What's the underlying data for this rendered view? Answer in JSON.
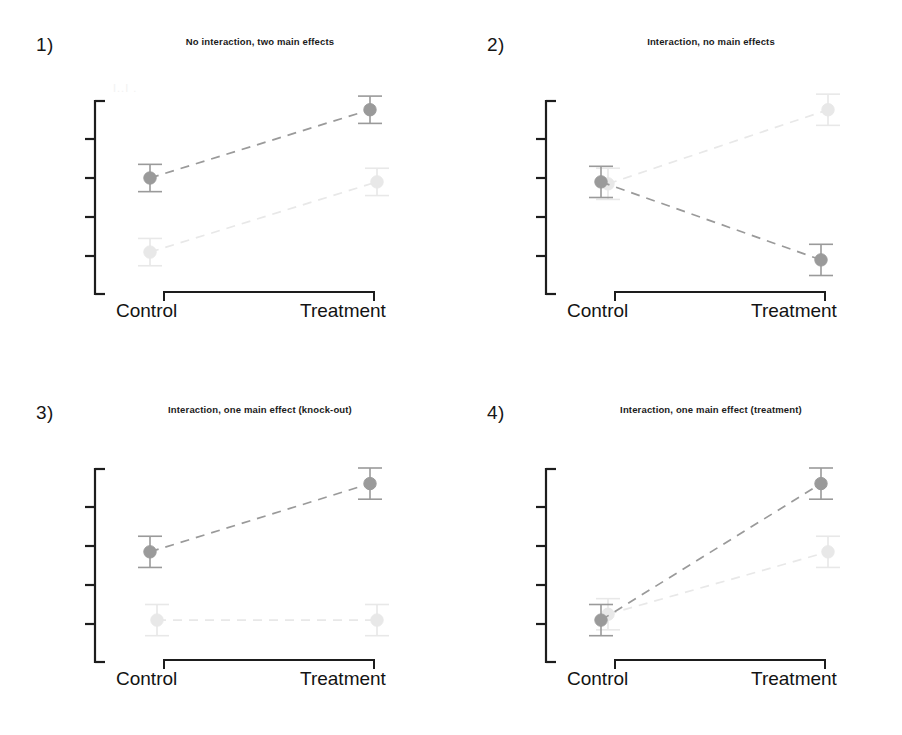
{
  "figure": {
    "background": "#ffffff",
    "width": 902,
    "height": 735
  },
  "panels": [
    {
      "number": "1)",
      "title": "No interaction, two main effects",
      "ghost_legend": "I..I .",
      "x_labels": {
        "left": "Control",
        "right": "Treatment"
      }
    },
    {
      "number": "2)",
      "title": "Interaction, no main effects",
      "ghost_legend": "",
      "x_labels": {
        "left": "Control",
        "right": "Treatment"
      }
    },
    {
      "number": "3)",
      "title": "Interaction, one main effect (knock-out)",
      "ghost_legend": "",
      "x_labels": {
        "left": "Control",
        "right": "Treatment"
      }
    },
    {
      "number": "4)",
      "title": "Interaction, one main effect (treatment)",
      "ghost_legend": "",
      "x_labels": {
        "left": "Control",
        "right": "Treatment"
      }
    }
  ],
  "colors": {
    "series_dark": "#9a9a9a",
    "series_light": "#e8e8e8",
    "axis": "#1d1d1d",
    "text": "#141414"
  },
  "chart_data": [
    {
      "type": "line",
      "title": "No interaction, two main effects",
      "panel": "1)",
      "categories": [
        "Control",
        "Treatment"
      ],
      "xlabel": "",
      "ylabel": "",
      "ylim": [
        0,
        100
      ],
      "grid": false,
      "legend": "none",
      "series": [
        {
          "name": "dark",
          "color": "#9a9a9a",
          "values": [
            60,
            95
          ],
          "errors": [
            7,
            7
          ],
          "x_offset": [
            0,
            0
          ]
        },
        {
          "name": "light",
          "color": "#e8e8e8",
          "values": [
            22,
            58
          ],
          "errors": [
            7,
            7
          ],
          "x_offset": [
            0,
            7
          ]
        }
      ]
    },
    {
      "type": "line",
      "title": "Interaction, no main effects",
      "panel": "2)",
      "categories": [
        "Control",
        "Treatment"
      ],
      "xlabel": "",
      "ylabel": "",
      "ylim": [
        0,
        100
      ],
      "grid": false,
      "legend": "none",
      "series": [
        {
          "name": "dark",
          "color": "#9a9a9a",
          "values": [
            58,
            18
          ],
          "errors": [
            8,
            8
          ],
          "x_offset": [
            0,
            0
          ]
        },
        {
          "name": "light",
          "color": "#e8e8e8",
          "values": [
            57,
            95
          ],
          "errors": [
            8,
            8
          ],
          "x_offset": [
            7,
            7
          ]
        }
      ]
    },
    {
      "type": "line",
      "title": "Interaction, one main effect (knock-out)",
      "panel": "3)",
      "categories": [
        "Control",
        "Treatment"
      ],
      "xlabel": "",
      "ylabel": "",
      "ylim": [
        0,
        100
      ],
      "grid": false,
      "legend": "none",
      "series": [
        {
          "name": "dark",
          "color": "#9a9a9a",
          "values": [
            57,
            92
          ],
          "errors": [
            8,
            8
          ],
          "x_offset": [
            0,
            0
          ]
        },
        {
          "name": "light",
          "color": "#e8e8e8",
          "values": [
            22,
            22
          ],
          "errors": [
            8,
            8
          ],
          "x_offset": [
            7,
            7
          ]
        }
      ]
    },
    {
      "type": "line",
      "title": "Interaction, one main effect (treatment)",
      "panel": "4)",
      "categories": [
        "Control",
        "Treatment"
      ],
      "xlabel": "",
      "ylabel": "",
      "ylim": [
        0,
        100
      ],
      "grid": false,
      "legend": "none",
      "series": [
        {
          "name": "dark",
          "color": "#9a9a9a",
          "values": [
            22,
            92
          ],
          "errors": [
            8,
            8
          ],
          "x_offset": [
            0,
            0
          ]
        },
        {
          "name": "light",
          "color": "#e8e8e8",
          "values": [
            25,
            57
          ],
          "errors": [
            8,
            8
          ],
          "x_offset": [
            7,
            7
          ]
        }
      ]
    }
  ]
}
